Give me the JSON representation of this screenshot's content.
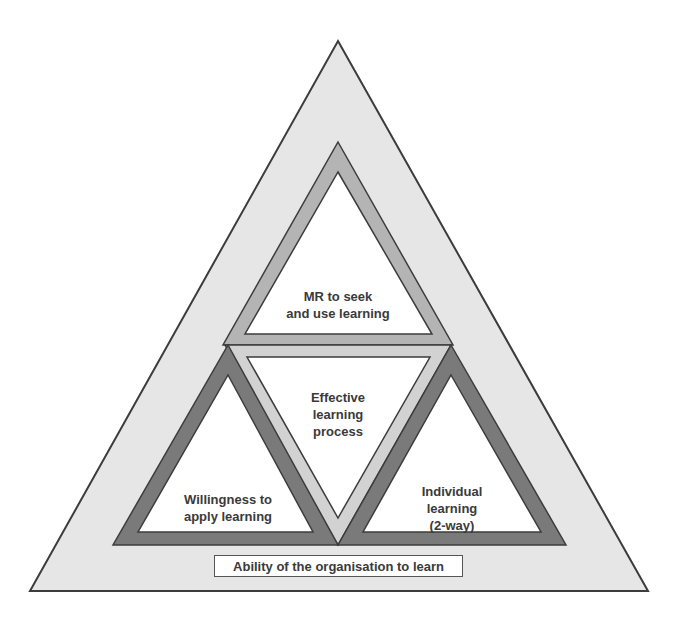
{
  "diagram": {
    "outer": {
      "label": "Ability of the organisation to learn"
    },
    "top": {
      "line1": "MR to seek",
      "line2": "and use learning"
    },
    "center": {
      "line1": "Effective",
      "line2": "learning",
      "line3": "process"
    },
    "left": {
      "line1": "Willingness to",
      "line2": "apply learning"
    },
    "right": {
      "line1": "Individual",
      "line2": "learning",
      "line3": "(2-way)"
    }
  },
  "colors": {
    "outer_fill": "#e6e6e6",
    "top_band": "#b4b4b4",
    "center_band": "#d2d2d2",
    "corner_band": "#7a7a7a",
    "inner_fill": "#ffffff",
    "stroke": "#3c3c3c"
  }
}
